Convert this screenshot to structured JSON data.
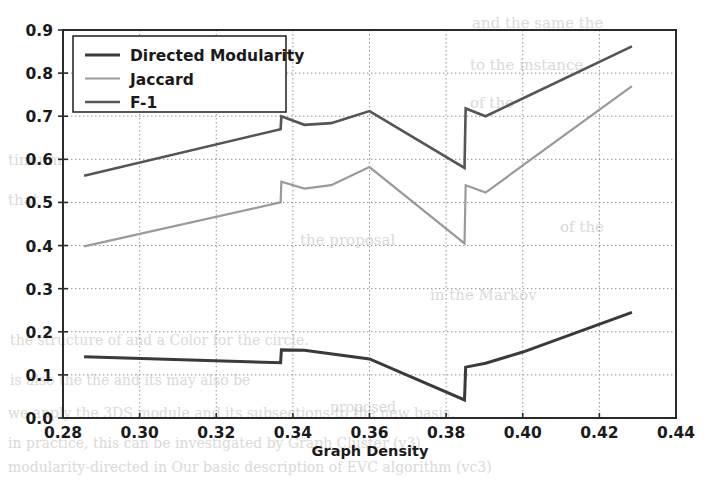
{
  "chart_data": {
    "type": "line",
    "title": "",
    "xlabel": "Graph Density",
    "ylabel": "",
    "xlim": [
      0.28,
      0.44
    ],
    "ylim": [
      0.0,
      0.9
    ],
    "xticks": [
      0.28,
      0.3,
      0.32,
      0.34,
      0.36,
      0.38,
      0.4,
      0.42,
      0.44
    ],
    "xtick_labels": [
      "0.28",
      "0.30",
      "0.32",
      "0.34",
      "0.36",
      "0.38",
      "0.40",
      "0.42",
      "0.44"
    ],
    "yticks": [
      0.0,
      0.1,
      0.2,
      0.3,
      0.4,
      0.5,
      0.6,
      0.7,
      0.8,
      0.9
    ],
    "ytick_labels": [
      "0.0",
      "0.1",
      "0.2",
      "0.3",
      "0.4",
      "0.5",
      "0.6",
      "0.7",
      "0.8",
      "0.9"
    ],
    "grid": true,
    "grid_style": "dotted",
    "legend_position": "upper left",
    "series": [
      {
        "name": "Directed Modularity",
        "color": "#3a3a3a",
        "width": 3.0,
        "x": [
          0.2855,
          0.3368,
          0.337,
          0.343,
          0.36,
          0.3848,
          0.3851,
          0.3903,
          0.4,
          0.4285
        ],
        "y": [
          0.142,
          0.128,
          0.158,
          0.157,
          0.137,
          0.042,
          0.118,
          0.127,
          0.153,
          0.245
        ]
      },
      {
        "name": "Jaccard",
        "color": "#9a9a9a",
        "width": 2.2,
        "x": [
          0.2855,
          0.3368,
          0.337,
          0.343,
          0.35,
          0.36,
          0.3848,
          0.3851,
          0.3903,
          0.4285
        ],
        "y": [
          0.398,
          0.5,
          0.548,
          0.532,
          0.54,
          0.582,
          0.405,
          0.54,
          0.523,
          0.77
        ]
      },
      {
        "name": "F-1",
        "color": "#555555",
        "width": 2.6,
        "x": [
          0.2855,
          0.3368,
          0.337,
          0.343,
          0.35,
          0.36,
          0.3848,
          0.3851,
          0.3903,
          0.4285
        ],
        "y": [
          0.562,
          0.67,
          0.7,
          0.68,
          0.684,
          0.712,
          0.58,
          0.718,
          0.7,
          0.862
        ]
      }
    ]
  },
  "legend": {
    "items": [
      {
        "label": "Directed Modularity"
      },
      {
        "label": "Jaccard"
      },
      {
        "label": "F-1"
      }
    ]
  },
  "background_bleed": [
    {
      "text": "and the same the",
      "x": 472,
      "y": 28,
      "size": 15
    },
    {
      "text": "to the instance",
      "x": 470,
      "y": 70,
      "size": 15
    },
    {
      "text": "of the",
      "x": 470,
      "y": 108,
      "size": 15
    },
    {
      "text": "tinuum",
      "x": 8,
      "y": 165,
      "size": 15
    },
    {
      "text": "that",
      "x": 8,
      "y": 205,
      "size": 15
    },
    {
      "text": "the proposal",
      "x": 300,
      "y": 245,
      "size": 15
    },
    {
      "text": "of the",
      "x": 560,
      "y": 232,
      "size": 15
    },
    {
      "text": "in the Markov",
      "x": 430,
      "y": 300,
      "size": 15
    },
    {
      "text": "the structure of and a Color for the circle.",
      "x": 10,
      "y": 345,
      "size": 14
    },
    {
      "text": "is also the the and its may also be",
      "x": 10,
      "y": 385,
      "size": 14
    },
    {
      "text": "proposed",
      "x": 330,
      "y": 412,
      "size": 14
    },
    {
      "text": "we apply the 3DS module and its subsections to the new basis.",
      "x": 8,
      "y": 418,
      "size": 14
    },
    {
      "text": "in practice, this can be investigated by Graph Cluster (v3)",
      "x": 8,
      "y": 448,
      "size": 14
    },
    {
      "text": "modularity-directed in Our basic description of EVC algorithm (vc3)",
      "x": 8,
      "y": 472,
      "size": 14
    }
  ]
}
